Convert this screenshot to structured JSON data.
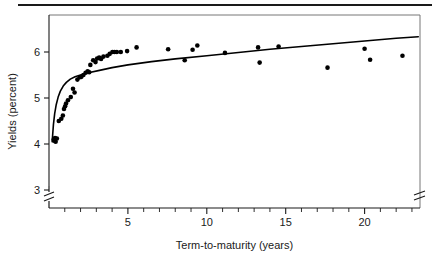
{
  "figure": {
    "separator_rule": true
  },
  "chart_data": {
    "type": "scatter",
    "title": "",
    "xlabel": "Term-to-maturity (years)",
    "ylabel": "Yields (percent)",
    "xlim": [
      0,
      23.5
    ],
    "ylim": [
      2.6,
      6.6
    ],
    "grid": false,
    "legend": "none",
    "x_ticks": [
      5,
      10,
      15,
      20
    ],
    "x_tick_labels": [
      "5",
      "10",
      "15",
      "20"
    ],
    "x_minor_tick_interval": 1,
    "y_ticks": [
      3,
      4,
      5,
      6
    ],
    "y_tick_labels": [
      "3",
      "4",
      "5",
      "6"
    ],
    "axis_break": {
      "y_axis_below": 3,
      "x_axis_right_edge": true
    },
    "points": [
      {
        "x": 0.3,
        "y": 4.1
      },
      {
        "x": 0.33,
        "y": 4.07
      },
      {
        "x": 0.38,
        "y": 4.13
      },
      {
        "x": 0.42,
        "y": 4.05
      },
      {
        "x": 0.5,
        "y": 4.12
      },
      {
        "x": 0.62,
        "y": 4.5
      },
      {
        "x": 0.78,
        "y": 4.55
      },
      {
        "x": 0.88,
        "y": 4.62
      },
      {
        "x": 0.95,
        "y": 4.76
      },
      {
        "x": 1.02,
        "y": 4.82
      },
      {
        "x": 1.08,
        "y": 4.88
      },
      {
        "x": 1.2,
        "y": 4.95
      },
      {
        "x": 1.38,
        "y": 5.02
      },
      {
        "x": 1.52,
        "y": 5.2
      },
      {
        "x": 1.62,
        "y": 5.12
      },
      {
        "x": 1.8,
        "y": 5.4
      },
      {
        "x": 1.95,
        "y": 5.45
      },
      {
        "x": 2.05,
        "y": 5.46
      },
      {
        "x": 2.18,
        "y": 5.5
      },
      {
        "x": 2.32,
        "y": 5.55
      },
      {
        "x": 2.45,
        "y": 5.58
      },
      {
        "x": 2.55,
        "y": 5.56
      },
      {
        "x": 2.62,
        "y": 5.72
      },
      {
        "x": 2.8,
        "y": 5.82
      },
      {
        "x": 2.95,
        "y": 5.78
      },
      {
        "x": 3.05,
        "y": 5.86
      },
      {
        "x": 3.18,
        "y": 5.88
      },
      {
        "x": 3.3,
        "y": 5.85
      },
      {
        "x": 3.45,
        "y": 5.9
      },
      {
        "x": 3.7,
        "y": 5.92
      },
      {
        "x": 3.85,
        "y": 5.96
      },
      {
        "x": 4.02,
        "y": 6.0
      },
      {
        "x": 4.15,
        "y": 6.0
      },
      {
        "x": 4.3,
        "y": 6.0
      },
      {
        "x": 4.55,
        "y": 6.0
      },
      {
        "x": 4.95,
        "y": 6.02
      },
      {
        "x": 5.55,
        "y": 6.1
      },
      {
        "x": 7.55,
        "y": 6.06
      },
      {
        "x": 8.6,
        "y": 5.82
      },
      {
        "x": 9.1,
        "y": 6.05
      },
      {
        "x": 9.4,
        "y": 6.14
      },
      {
        "x": 11.15,
        "y": 5.98
      },
      {
        "x": 13.25,
        "y": 6.1
      },
      {
        "x": 13.35,
        "y": 5.77
      },
      {
        "x": 14.55,
        "y": 6.12
      },
      {
        "x": 17.65,
        "y": 5.66
      },
      {
        "x": 20.0,
        "y": 6.07
      },
      {
        "x": 20.35,
        "y": 5.83
      },
      {
        "x": 22.4,
        "y": 5.92
      }
    ],
    "fit_curve": {
      "label": "fitted yield curve",
      "type": "logarithmic",
      "points": [
        {
          "x": 0.2,
          "y": 4.05
        },
        {
          "x": 0.28,
          "y": 4.42
        },
        {
          "x": 0.36,
          "y": 4.66
        },
        {
          "x": 0.46,
          "y": 4.86
        },
        {
          "x": 0.58,
          "y": 5.02
        },
        {
          "x": 0.72,
          "y": 5.15
        },
        {
          "x": 0.9,
          "y": 5.26
        },
        {
          "x": 1.1,
          "y": 5.34
        },
        {
          "x": 1.35,
          "y": 5.41
        },
        {
          "x": 1.65,
          "y": 5.46
        },
        {
          "x": 2.0,
          "y": 5.5
        },
        {
          "x": 2.5,
          "y": 5.55
        },
        {
          "x": 3.2,
          "y": 5.6
        },
        {
          "x": 4.0,
          "y": 5.66
        },
        {
          "x": 5.0,
          "y": 5.72
        },
        {
          "x": 6.5,
          "y": 5.79
        },
        {
          "x": 8.0,
          "y": 5.85
        },
        {
          "x": 10.0,
          "y": 5.92
        },
        {
          "x": 12.0,
          "y": 5.99
        },
        {
          "x": 14.0,
          "y": 6.06
        },
        {
          "x": 16.0,
          "y": 6.12
        },
        {
          "x": 18.0,
          "y": 6.18
        },
        {
          "x": 20.0,
          "y": 6.24
        },
        {
          "x": 22.0,
          "y": 6.3
        },
        {
          "x": 23.4,
          "y": 6.33
        }
      ]
    }
  }
}
